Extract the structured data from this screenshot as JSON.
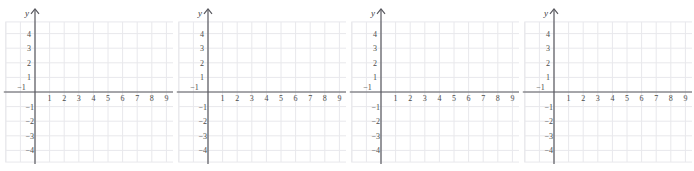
{
  "page": {
    "background_color": "#ffffff",
    "width": 694,
    "height": 171
  },
  "style": {
    "grid_line_color": "#e8e8ec",
    "grid_major_color": "#dcdce2",
    "axis_color": "#58585e",
    "tick_text_color": "#4a4a4a",
    "axis_label_color": "#3b3b3b",
    "cell_size_px": 14.6
  },
  "chart_data": {
    "type": "scatter",
    "title": "",
    "xlabel": "x",
    "ylabel": "y",
    "xlim": [
      -1.6,
      10.4
    ],
    "ylim": [
      -5.2,
      5.2
    ],
    "grid": true,
    "legend": null,
    "series": [],
    "x_ticks": [
      1,
      2,
      3,
      4,
      5,
      6,
      7,
      8,
      9
    ],
    "x_tick_labels": [
      "1",
      "2",
      "3",
      "4",
      "5",
      "6",
      "7",
      "8",
      "9"
    ],
    "x_negative_ticks": [
      -1
    ],
    "x_negative_tick_labels": [
      "−1"
    ],
    "y_ticks": [
      4,
      3,
      2,
      1
    ],
    "y_tick_labels": [
      "4",
      "3",
      "2",
      "1"
    ],
    "y_negative_ticks": [
      -1,
      -2,
      -3,
      -4
    ],
    "y_negative_tick_labels": [
      "−1",
      "−2",
      "−3",
      "−4"
    ],
    "panel_count": 4
  },
  "panels": [
    {
      "id": "panel-1",
      "x_axis_label": "x",
      "y_axis_label": "y",
      "x_tick_labels": [
        "1",
        "2",
        "3",
        "4",
        "5",
        "6",
        "7",
        "8",
        "9"
      ],
      "x_negative_tick_labels": [
        "−1"
      ],
      "y_tick_labels": [
        "4",
        "3",
        "2",
        "1"
      ],
      "y_negative_tick_labels": [
        "−1",
        "−2",
        "−3",
        "−4"
      ]
    },
    {
      "id": "panel-2",
      "x_axis_label": "x",
      "y_axis_label": "y",
      "x_tick_labels": [
        "1",
        "2",
        "3",
        "4",
        "5",
        "6",
        "7",
        "8",
        "9"
      ],
      "x_negative_tick_labels": [
        "−1"
      ],
      "y_tick_labels": [
        "4",
        "3",
        "2",
        "1"
      ],
      "y_negative_tick_labels": [
        "−1",
        "−2",
        "−3",
        "−4"
      ]
    },
    {
      "id": "panel-3",
      "x_axis_label": "x",
      "y_axis_label": "y",
      "x_tick_labels": [
        "1",
        "2",
        "3",
        "4",
        "5",
        "6",
        "7",
        "8",
        "9"
      ],
      "x_negative_tick_labels": [
        "−1"
      ],
      "y_tick_labels": [
        "4",
        "3",
        "2",
        "1"
      ],
      "y_negative_tick_labels": [
        "−1",
        "−2",
        "−3",
        "−4"
      ]
    },
    {
      "id": "panel-4",
      "x_axis_label": "x",
      "y_axis_label": "y",
      "x_tick_labels": [
        "1",
        "2",
        "3",
        "4",
        "5",
        "6",
        "7",
        "8",
        "9"
      ],
      "x_negative_tick_labels": [
        "−1"
      ],
      "y_tick_labels": [
        "4",
        "3",
        "2",
        "1"
      ],
      "y_negative_tick_labels": [
        "−1",
        "−2",
        "−3",
        "−4"
      ]
    }
  ]
}
